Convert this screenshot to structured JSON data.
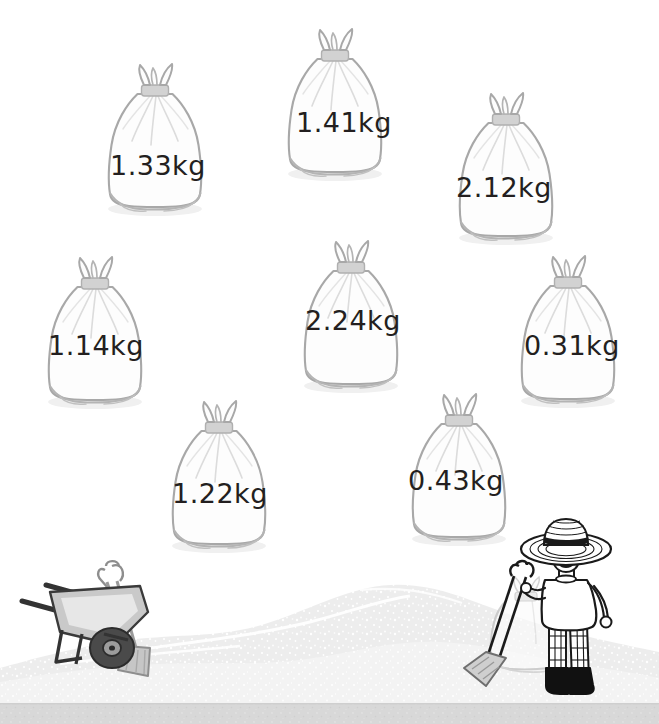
{
  "scene": {
    "title": "Sandbags with weight labels",
    "background_color": "#ffffff",
    "ground_band_color": "#d8d8d8",
    "sand_pile_color": "#ededed",
    "bag_fill_color": "#fdfdfd",
    "bag_outline_color": "#a8a8a8",
    "bag_tie_color": "#cccccc",
    "label_text_color": "#231f20"
  },
  "bags": [
    {
      "id": "bag-1",
      "weight": "1.33",
      "unit": "kg",
      "label": "1.33kg",
      "value_kg": 1.33,
      "x": 96,
      "y": 63,
      "w": 118,
      "h": 155,
      "label_x": 110,
      "label_y": 150
    },
    {
      "id": "bag-2",
      "weight": "1.41",
      "unit": "kg",
      "label": "1.41kg",
      "value_kg": 1.41,
      "x": 276,
      "y": 28,
      "w": 118,
      "h": 155,
      "label_x": 296,
      "label_y": 107
    },
    {
      "id": "bag-3",
      "weight": "2.12",
      "unit": "kg",
      "label": "2.12kg",
      "value_kg": 2.12,
      "x": 447,
      "y": 92,
      "w": 118,
      "h": 155,
      "label_x": 456,
      "label_y": 172
    },
    {
      "id": "bag-4",
      "weight": "1.14",
      "unit": "kg",
      "label": "1.14kg",
      "value_kg": 1.14,
      "x": 36,
      "y": 256,
      "w": 118,
      "h": 155,
      "label_x": 48,
      "label_y": 330
    },
    {
      "id": "bag-5",
      "weight": "2.24",
      "unit": "kg",
      "label": "2.24kg",
      "value_kg": 2.24,
      "x": 292,
      "y": 240,
      "w": 118,
      "h": 155,
      "label_x": 305,
      "label_y": 305
    },
    {
      "id": "bag-6",
      "weight": "0.31",
      "unit": "kg",
      "label": "0.31kg",
      "value_kg": 0.31,
      "x": 509,
      "y": 255,
      "w": 118,
      "h": 155,
      "label_x": 524,
      "label_y": 330
    },
    {
      "id": "bag-7",
      "weight": "1.22",
      "unit": "kg",
      "label": "1.22kg",
      "value_kg": 1.22,
      "x": 160,
      "y": 400,
      "w": 118,
      "h": 155,
      "label_x": 172,
      "label_y": 478
    },
    {
      "id": "bag-8",
      "weight": "0.43",
      "unit": "kg",
      "label": "0.43kg",
      "value_kg": 0.43,
      "x": 400,
      "y": 393,
      "w": 118,
      "h": 155,
      "label_x": 408,
      "label_y": 465
    }
  ],
  "figures": {
    "wheelbarrow": {
      "name": "wheelbarrow",
      "tray_color": "#c9c9c9",
      "frame_color": "#3a3a3a",
      "wheel_color": "#4a4a4a"
    },
    "shovel_left": {
      "name": "shovel",
      "color": "#8a8a8a"
    },
    "worker": {
      "name": "worker",
      "hat": "straw-hat",
      "hat_band_color": "#1a1a1a",
      "shirt_color": "#ffffff",
      "trousers": "checkered",
      "boots_color": "#111111",
      "holding": "shovel"
    },
    "worker_sack": {
      "name": "sandbag-behind-worker"
    }
  }
}
